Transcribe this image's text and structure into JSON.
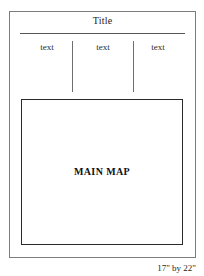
{
  "sheet": {
    "title": "Title",
    "dimensions_label": "17\" by 22\"",
    "border_color": "#7d7d7d",
    "background_color": "#ffffff"
  },
  "text_columns": {
    "items": [
      {
        "label": "text"
      },
      {
        "label": "text"
      },
      {
        "label": "text"
      }
    ]
  },
  "main_map": {
    "label": "MAIN MAP",
    "border_color": "#2a2a2a",
    "fill_color": "#ffffff"
  }
}
